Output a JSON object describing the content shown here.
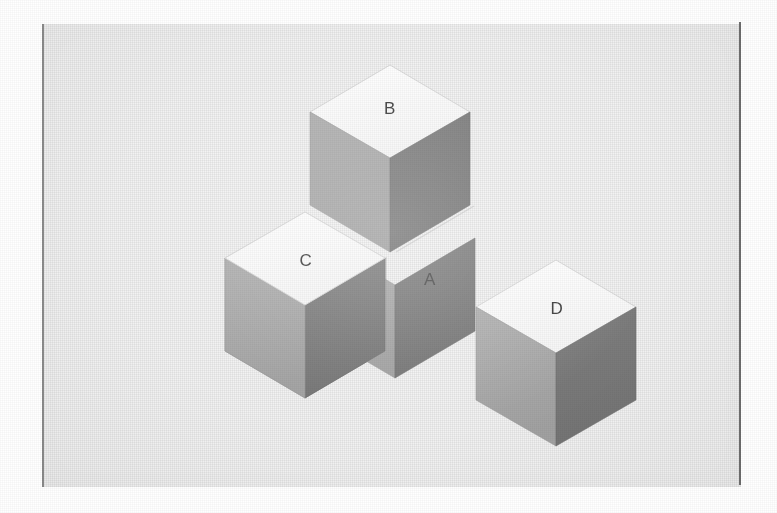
{
  "page": {
    "background_color": "#ffffff",
    "panel_color": "#f2f2f2",
    "scan_edge_color": "#8d8d8d",
    "width": 777,
    "height": 513
  },
  "figure": {
    "kind": "isometric-block-diagram",
    "projection": "isometric",
    "cube_edge_px": 80,
    "colors": {
      "top_face": "#fbfbfb",
      "left_face": "#a9a9a9",
      "right_face": "#7a7a7a",
      "edge_line": "#bdbdbd",
      "label_text": "#3a3a3a"
    },
    "cubes": [
      {
        "id": "cube-a",
        "label": "A",
        "label_face": "right",
        "label_x": 430,
        "label_y": 281,
        "origin_x": 395,
        "origin_y": 238,
        "note": "base cube at corner of the L, labeled on its dark right face"
      },
      {
        "id": "cube-b",
        "label": "B",
        "label_face": "top",
        "label_x": 390,
        "label_y": 110,
        "origin_x": 395,
        "origin_y": 158,
        "note": "stacked directly on top of cube A"
      },
      {
        "id": "cube-c",
        "label": "C",
        "label_face": "top",
        "label_x": 306,
        "label_y": 262,
        "origin_x": 305,
        "origin_y": 305,
        "note": "adjacent to cube A on the left-front arm of the L"
      },
      {
        "id": "cube-d",
        "label": "D",
        "label_face": "top",
        "label_x": 557,
        "label_y": 310,
        "origin_x": 556,
        "origin_y": 353,
        "note": "separate detached cube to the lower right"
      }
    ]
  }
}
